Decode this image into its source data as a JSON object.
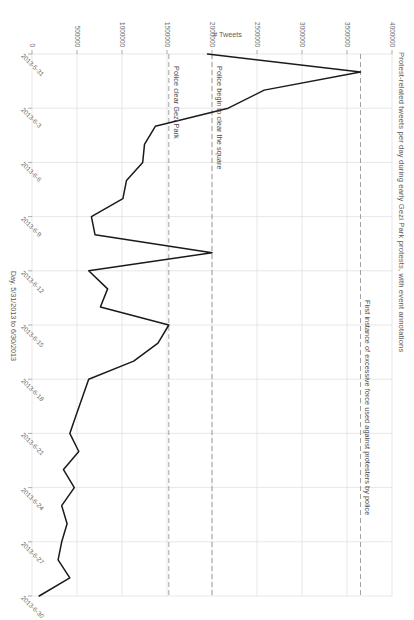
{
  "chart_data": {
    "type": "line",
    "title": "Protest-related tweets per day during early Gezi Park protests, with event annotations",
    "xlabel": "Day, 5/31/2013 to 6/30/2013",
    "ylabel": "# Tweets",
    "grid": true,
    "legend": null,
    "xlim": [
      "2013-5-31",
      "2013-6-30"
    ],
    "ylim": [
      0,
      4000000
    ],
    "x_tick_labels": [
      "2013-5-31",
      "2013-6-3",
      "2013-6-6",
      "2013-6-9",
      "2013-6-12",
      "2013-6-15",
      "2013-6-18",
      "2013-6-21",
      "2013-6-24",
      "2013-6-27",
      "2013-6-30"
    ],
    "y_tick_labels": [
      "0",
      "500000",
      "1000000",
      "1500000",
      "2000000",
      "2500000",
      "3000000",
      "3500000",
      "4000000"
    ],
    "y_tick_values": [
      0,
      500000,
      1000000,
      1500000,
      2000000,
      2500000,
      3000000,
      3500000,
      4000000
    ],
    "line_color": "#1a1a1a",
    "x": [
      "2013-5-31",
      "2013-6-1",
      "2013-6-2",
      "2013-6-3",
      "2013-6-4",
      "2013-6-5",
      "2013-6-6",
      "2013-6-7",
      "2013-6-8",
      "2013-6-9",
      "2013-6-10",
      "2013-6-11",
      "2013-6-12",
      "2013-6-13",
      "2013-6-14",
      "2013-6-15",
      "2013-6-16",
      "2013-6-17",
      "2013-6-18",
      "2013-6-19",
      "2013-6-20",
      "2013-6-21",
      "2013-6-22",
      "2013-6-23",
      "2013-6-24",
      "2013-6-25",
      "2013-6-26",
      "2013-6-27",
      "2013-6-28",
      "2013-6-29",
      "2013-6-30"
    ],
    "values": [
      1950000,
      3650000,
      2580000,
      2180000,
      1370000,
      1250000,
      1230000,
      1050000,
      1010000,
      660000,
      700000,
      2000000,
      630000,
      840000,
      760000,
      1520000,
      1400000,
      1130000,
      630000,
      560000,
      490000,
      420000,
      520000,
      350000,
      470000,
      330000,
      390000,
      330000,
      290000,
      420000,
      80000
    ],
    "annotations": [
      {
        "id": "first-force",
        "label": "First instance of excessive force used against protesters by police",
        "y_value": 3650000,
        "line_style": "dashed"
      },
      {
        "id": "clear-square",
        "label": "Police begin to clear the square",
        "y_value": 2000000,
        "line_style": "dashed"
      },
      {
        "id": "clear-park",
        "label": "Police clear Gezi Park",
        "y_value": 1520000,
        "line_style": "dashed"
      }
    ]
  }
}
